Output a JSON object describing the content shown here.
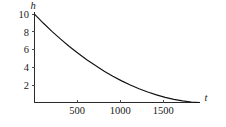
{
  "chart_data": {
    "type": "line",
    "title": "",
    "subtitle": "",
    "xlabel": "t",
    "ylabel": "h",
    "xlim": [
      0,
      1900
    ],
    "ylim": [
      0,
      10.6
    ],
    "grid": false,
    "legend": null,
    "x_ticks": [
      500,
      1000,
      1500
    ],
    "x_tick_labels": [
      "500",
      "1000",
      "1500"
    ],
    "y_ticks": [
      2,
      4,
      6,
      8,
      10
    ],
    "y_tick_labels": [
      "2",
      "4",
      "6",
      "8",
      "10"
    ],
    "series": [
      {
        "name": "h(t)",
        "description": "exponential decay of height h with time t",
        "x": [
          0,
          100,
          200,
          300,
          400,
          500,
          600,
          700,
          800,
          900,
          1000,
          1100,
          1200,
          1300,
          1400,
          1500,
          1600,
          1700,
          1800,
          1900
        ],
        "y": [
          10.0,
          9.0,
          8.06,
          7.18,
          6.35,
          5.58,
          4.85,
          4.18,
          3.55,
          2.98,
          2.45,
          1.98,
          1.55,
          1.18,
          0.86,
          0.58,
          0.36,
          0.18,
          0.06,
          0.0
        ]
      }
    ],
    "annotations": []
  },
  "axes": {
    "x_axis_name": "t",
    "y_axis_name": "h"
  },
  "colors": {
    "background": "#ffffff",
    "curve": "#111111",
    "axis": "#2a2a2a",
    "text": "#1a1a1a"
  }
}
